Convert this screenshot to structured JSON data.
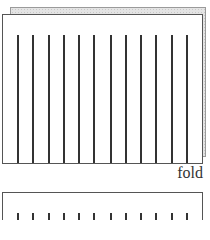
{
  "diagram": {
    "type": "folded-paper-illustration",
    "fold_label": "fold",
    "top_panel": {
      "line_count": 12,
      "line_x": [
        17,
        32,
        48,
        63,
        78,
        93,
        110,
        125,
        140,
        155,
        171,
        186
      ],
      "line_top": 35,
      "line_bottom": 163
    },
    "bottom_panel": {
      "line_count": 12,
      "line_x": [
        17,
        32,
        48,
        63,
        78,
        93,
        110,
        125,
        140,
        155,
        171,
        186
      ],
      "line_top": 213
    },
    "colors": {
      "outline": "#555555",
      "lines": "#333333",
      "back_sheet": "#e4e4e4"
    }
  }
}
